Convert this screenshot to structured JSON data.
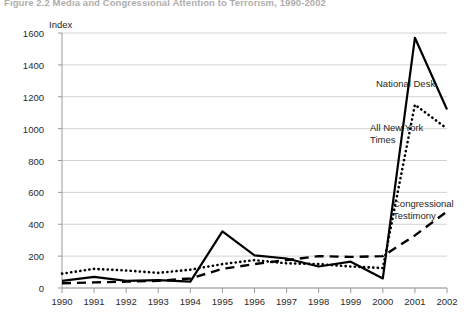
{
  "figure": {
    "title": "Figure 2.2   Media and Congressional Attention to Terrorism, 1990-2002",
    "axis_unit_label": "Index"
  },
  "annotations": {
    "national_desk": "National Desk",
    "all_new_york_times": "All New York Times",
    "congressional_testimony": "Congressional Testimony"
  },
  "colors": {
    "line": "#000000",
    "grid": "#c8c8c8",
    "axis": "#9a9a9a",
    "text": "#1e1e1e",
    "title": "#6b6b6b"
  },
  "chart_data": {
    "type": "line",
    "title": "Figure 2.2   Media and Congressional Attention to Terrorism, 1990-2002",
    "xlabel": "",
    "ylabel": "Index",
    "ylim": [
      0,
      1600
    ],
    "ytick_step": 200,
    "yticks": [
      0,
      200,
      400,
      600,
      800,
      1000,
      1200,
      1400,
      1600
    ],
    "grid": true,
    "legend": "inline-annotations",
    "categories": [
      "1990",
      "1991",
      "1992",
      "1993",
      "1994",
      "1995",
      "1996",
      "1997",
      "1998",
      "1999",
      "2000",
      "2001",
      "2002"
    ],
    "series": [
      {
        "name": "National Desk",
        "style": "solid",
        "values": [
          45,
          70,
          45,
          50,
          40,
          355,
          205,
          185,
          135,
          165,
          60,
          1570,
          1120
        ]
      },
      {
        "name": "All New York Times",
        "style": "dotted",
        "values": [
          90,
          120,
          110,
          95,
          115,
          150,
          175,
          155,
          150,
          135,
          125,
          1150,
          1000
        ]
      },
      {
        "name": "Congressional Testimony",
        "style": "dashed",
        "values": [
          30,
          35,
          40,
          45,
          60,
          120,
          150,
          175,
          200,
          195,
          200,
          330,
          480
        ]
      }
    ]
  }
}
